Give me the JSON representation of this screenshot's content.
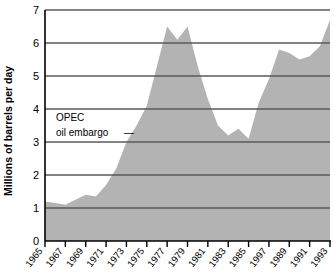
{
  "chart_data": {
    "type": "area",
    "title": "",
    "xlabel": "",
    "ylabel": "Millions of barrels per day",
    "ylim": [
      0,
      7
    ],
    "xlim": [
      1965,
      1993
    ],
    "grid": true,
    "legend": "none",
    "series_name": "Net petroleum imports",
    "x": [
      1965,
      1966,
      1967,
      1968,
      1969,
      1970,
      1971,
      1972,
      1973,
      1974,
      1975,
      1976,
      1977,
      1978,
      1979,
      1980,
      1981,
      1982,
      1983,
      1984,
      1985,
      1986,
      1987,
      1988,
      1989,
      1990,
      1991,
      1992,
      1993
    ],
    "values": [
      1.2,
      1.15,
      1.1,
      1.25,
      1.4,
      1.35,
      1.7,
      2.2,
      3.0,
      3.5,
      4.1,
      5.3,
      6.5,
      6.1,
      6.5,
      5.3,
      4.3,
      3.5,
      3.2,
      3.4,
      3.1,
      4.2,
      4.9,
      5.8,
      5.7,
      5.5,
      5.6,
      5.9,
      6.7
    ],
    "y_ticks": [
      0,
      1,
      2,
      3,
      4,
      5,
      6,
      7
    ],
    "y_tick_labels": [
      "0",
      "1",
      "2",
      "3",
      "4",
      "5",
      "6",
      "7"
    ],
    "x_ticks": [
      1965,
      1967,
      1969,
      1971,
      1973,
      1975,
      1977,
      1979,
      1981,
      1983,
      1985,
      1997,
      1989,
      1991,
      1993
    ],
    "x_tick_labels": [
      "1965",
      "1967",
      "1969",
      "1971",
      "1973",
      "1975",
      "1977",
      "1979",
      "1981",
      "1983",
      "1985",
      "1997",
      "1989",
      "1991",
      "1993"
    ],
    "annotations": [
      {
        "name": "opec-oil-embargo",
        "line1": "OPEC",
        "line2": "oil embargo",
        "leader": "—",
        "points_to_year": 1973,
        "points_to_value": 3.0
      }
    ],
    "colors": {
      "area_fill": "#b3b3b3",
      "gridline": "#5a5a5a",
      "axis": "#000000",
      "text": "#000000",
      "background": "#ffffff"
    }
  }
}
